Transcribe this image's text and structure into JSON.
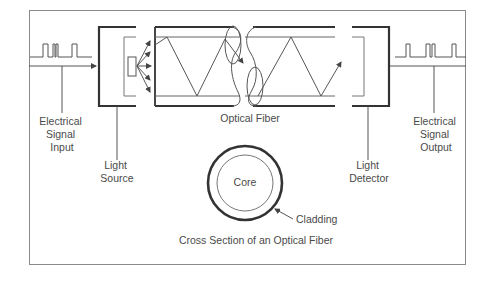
{
  "diagram": {
    "title": "Cross Section of an Optical Fiber",
    "labels": {
      "input_line1": "Electrical",
      "input_line2": "Signal",
      "input_line3": "Input",
      "source_line1": "Light",
      "source_line2": "Source",
      "fiber": "Optical Fiber",
      "detector_line1": "Light",
      "detector_line2": "Detector",
      "output_line1": "Electrical",
      "output_line2": "Signal",
      "output_line3": "Output",
      "core": "Core",
      "cladding": "Cladding",
      "caption": "Cross Section of an Optical Fiber"
    },
    "colors": {
      "line": "#555555",
      "thick": "#333333",
      "frame": "#888888",
      "text": "#4a4a4a"
    }
  }
}
